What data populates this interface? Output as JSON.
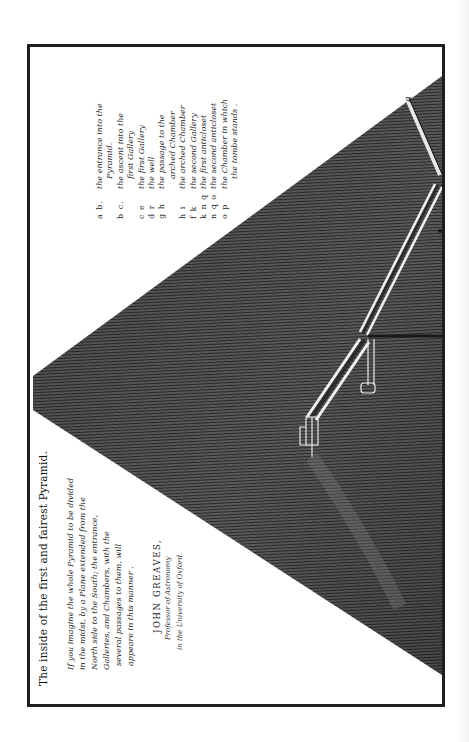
{
  "plate": {
    "title": "The inside of the first  and fairest  Pyramid.",
    "description": [
      "If you imagine the whole Pyramid to be divided",
      "in the midst, by a Plane extended from the",
      "North side to the South; the entrance,",
      "Galleries, and Chambers, with the",
      "several passages to them, will",
      "appeare in this manner ."
    ],
    "author": {
      "name": "JOHN GREAVES,",
      "role": "Professor of Astronomy",
      "institution": "in the University of Oxford."
    },
    "legend": [
      {
        "key": "a b.",
        "text": "the entrance into the",
        "cont": "Pyramid."
      },
      {
        "key": "b c.",
        "text": "the ascent into the",
        "cont": "first Gallery"
      },
      {
        "key": "c e",
        "text": "the first Gallery",
        "cont": ""
      },
      {
        "key": "d r",
        "text": "the well",
        "cont": ""
      },
      {
        "key": "g h",
        "text": "the passage to the",
        "cont": "arched Chamber"
      },
      {
        "key": "h i",
        "text": "the arched Chamber",
        "cont": ""
      },
      {
        "key": "f k",
        "text": "the second Gallery",
        "cont": ""
      },
      {
        "key": "k n q",
        "text": "the first anticloset",
        "cont": ""
      },
      {
        "key": "n q o",
        "text": "the second anticloset",
        "cont": ""
      },
      {
        "key": "o p",
        "text": "the Chamber in which",
        "cont": "the tombe stands ."
      }
    ],
    "diagram_labels": {
      "entrance": "a"
    }
  },
  "colors": {
    "paper": "#ffffff",
    "ink": "#1e1e1e",
    "hatching_dark": "#3a3a3a",
    "hatching_mid": "#5a5a5a",
    "passage_highlight": "#e6e6e6"
  }
}
